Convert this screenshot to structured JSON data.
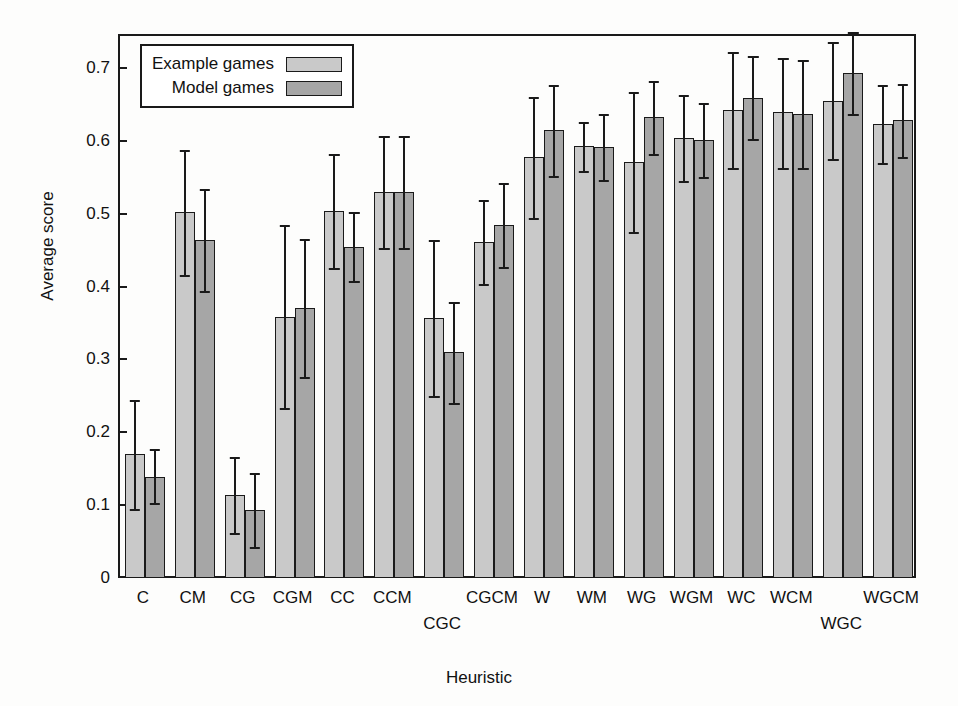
{
  "chart_data": {
    "type": "bar",
    "title": "",
    "xlabel": "Heuristic",
    "ylabel": "Average score",
    "ylim": [
      0,
      0.75
    ],
    "yticks": [
      0,
      0.1,
      0.2,
      0.3,
      0.4,
      0.5,
      0.6,
      0.7
    ],
    "ytick_labels": [
      "0",
      "0.1",
      "0.2",
      "0.3",
      "0.4",
      "0.5",
      "0.6",
      "0.7"
    ],
    "grid": false,
    "legend_position": "top-left",
    "error_bars": "yes",
    "categories": [
      "C",
      "CM",
      "CG",
      "CGM",
      "CC",
      "CCM",
      "CGC",
      "CGCM",
      "W",
      "WM",
      "WG",
      "WGM",
      "WC",
      "WCM",
      "WGC",
      "WGCM"
    ],
    "category_label_rows": [
      0,
      0,
      0,
      0,
      0,
      0,
      1,
      0,
      0,
      0,
      0,
      0,
      0,
      0,
      1,
      0
    ],
    "series": [
      {
        "name": "Example games",
        "color": "#c9c9c9",
        "values": [
          0.173,
          0.505,
          0.117,
          0.361,
          0.506,
          0.533,
          0.36,
          0.464,
          0.58,
          0.595,
          0.574,
          0.607,
          0.645,
          0.642,
          0.658,
          0.626
        ],
        "err_low": [
          0.098,
          0.419,
          0.065,
          0.236,
          0.428,
          0.456,
          0.253,
          0.406,
          0.497,
          0.562,
          0.478,
          0.548,
          0.566,
          0.566,
          0.578,
          0.572
        ],
        "err_high": [
          0.247,
          0.59,
          0.169,
          0.487,
          0.584,
          0.61,
          0.467,
          0.522,
          0.663,
          0.628,
          0.67,
          0.666,
          0.724,
          0.717,
          0.738,
          0.68
        ]
      },
      {
        "name": "Model games",
        "color": "#a6a6a6",
        "values": [
          0.142,
          0.466,
          0.096,
          0.373,
          0.457,
          0.533,
          0.313,
          0.487,
          0.617,
          0.594,
          0.635,
          0.604,
          0.662,
          0.64,
          0.696,
          0.631
        ],
        "err_low": [
          0.105,
          0.396,
          0.045,
          0.278,
          0.41,
          0.456,
          0.243,
          0.429,
          0.554,
          0.549,
          0.585,
          0.553,
          0.605,
          0.566,
          0.64,
          0.581
        ],
        "err_high": [
          0.18,
          0.537,
          0.147,
          0.468,
          0.505,
          0.61,
          0.382,
          0.545,
          0.68,
          0.639,
          0.685,
          0.655,
          0.719,
          0.714,
          0.752,
          0.681
        ]
      }
    ]
  },
  "legend": {
    "items": [
      {
        "label": "Example games",
        "kind": "example"
      },
      {
        "label": "Model games",
        "kind": "model"
      }
    ]
  }
}
